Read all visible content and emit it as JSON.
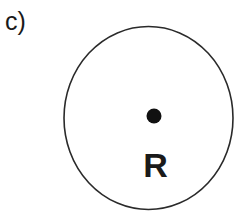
{
  "figure": {
    "panel_label": "c)",
    "boundary": {
      "shape": "ellipse",
      "cx": 148.5,
      "cy": 118,
      "rx": 84.5,
      "ry": 91.5,
      "stroke_color": "#2a2a2a"
    },
    "point": {
      "cx": 154,
      "cy": 116,
      "r": 7.5,
      "color": "#111111"
    },
    "region_label": "R"
  }
}
